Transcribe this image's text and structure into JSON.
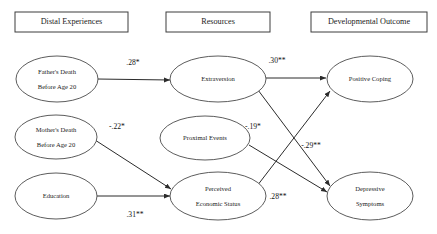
{
  "diagram": {
    "type": "path-diagram",
    "title": "",
    "columns": [
      {
        "id": "distal",
        "label": "Distal Experiences"
      },
      {
        "id": "resources",
        "label": "Resources"
      },
      {
        "id": "outcome",
        "label": "Developmental Outcome"
      }
    ],
    "nodes": [
      {
        "id": "fathers_death",
        "column": "distal",
        "line1": "Father's Death",
        "line2": "Before Age 20"
      },
      {
        "id": "mothers_death",
        "column": "distal",
        "line1": "Mother's Death",
        "line2": "Before Age 20"
      },
      {
        "id": "education",
        "column": "distal",
        "line1": "Education",
        "line2": ""
      },
      {
        "id": "extraversion",
        "column": "resources",
        "line1": "Extraversion",
        "line2": ""
      },
      {
        "id": "proximal_events",
        "column": "resources",
        "line1": "Proximal Events",
        "line2": ""
      },
      {
        "id": "perceived_economic_status",
        "column": "resources",
        "line1": "Perceived",
        "line2": "Economic Status"
      },
      {
        "id": "positive_coping",
        "column": "outcome",
        "line1": "Positive Coping",
        "line2": ""
      },
      {
        "id": "depressive_symptoms",
        "column": "outcome",
        "line1": "Depressive",
        "line2": "Symptoms"
      }
    ],
    "paths": [
      {
        "id": "p1",
        "from": "fathers_death",
        "to": "extraversion",
        "coefficient": ".28*"
      },
      {
        "id": "p2",
        "from": "extraversion",
        "to": "positive_coping",
        "coefficient": ".30**"
      },
      {
        "id": "p3",
        "from": "mothers_death",
        "to": "perceived_economic_status",
        "coefficient": "-.22*"
      },
      {
        "id": "p4",
        "from": "proximal_events",
        "to": "depressive_symptoms",
        "coefficient": "-.19*"
      },
      {
        "id": "p5",
        "from": "extraversion",
        "to": "depressive_symptoms",
        "coefficient": "-.29**"
      },
      {
        "id": "p6",
        "from": "education",
        "to": "perceived_economic_status",
        "coefficient": ".31**"
      },
      {
        "id": "p7",
        "from": "perceived_economic_status",
        "to": "positive_coping",
        "coefficient": ".28**"
      }
    ],
    "colors": {
      "stroke": "#2b2b2b",
      "box_stroke": "#3d3d3d",
      "text": "#1b1b1b",
      "background": "#ffffff"
    }
  }
}
